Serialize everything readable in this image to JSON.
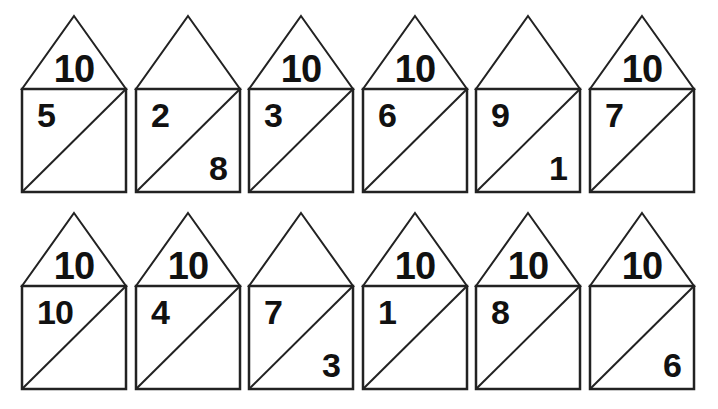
{
  "worksheet": {
    "rows": [
      {
        "houses": [
          {
            "roof": "10",
            "left": "5",
            "right": ""
          },
          {
            "roof": "",
            "left": "2",
            "right": "8"
          },
          {
            "roof": "10",
            "left": "3",
            "right": ""
          },
          {
            "roof": "10",
            "left": "6",
            "right": ""
          },
          {
            "roof": "",
            "left": "9",
            "right": "1"
          },
          {
            "roof": "10",
            "left": "7",
            "right": ""
          }
        ]
      },
      {
        "houses": [
          {
            "roof": "10",
            "left": "10",
            "right": ""
          },
          {
            "roof": "10",
            "left": "4",
            "right": ""
          },
          {
            "roof": "",
            "left": "7",
            "right": "3"
          },
          {
            "roof": "10",
            "left": "1",
            "right": ""
          },
          {
            "roof": "10",
            "left": "8",
            "right": ""
          },
          {
            "roof": "10",
            "left": "",
            "right": "6"
          }
        ]
      }
    ]
  }
}
